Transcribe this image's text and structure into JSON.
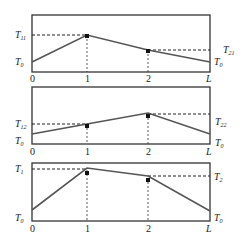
{
  "diagram": {
    "x_ticks": [
      "0",
      "1",
      "2",
      "L"
    ],
    "panels": [
      {
        "name": "panel-1",
        "left_labels": [
          {
            "base": "T",
            "sub": "11"
          },
          {
            "base": "T",
            "sub": "0"
          }
        ],
        "right_labels": [
          {
            "base": "T",
            "sub": "21"
          },
          {
            "base": "T",
            "sub": "0"
          }
        ]
      },
      {
        "name": "panel-2",
        "left_labels": [
          {
            "base": "T",
            "sub": "12"
          },
          {
            "base": "T",
            "sub": "0"
          }
        ],
        "right_labels": [
          {
            "base": "T",
            "sub": "22"
          },
          {
            "base": "T",
            "sub": "0"
          }
        ]
      },
      {
        "name": "panel-3",
        "left_labels": [
          {
            "base": "T",
            "sub": "1"
          },
          {
            "base": "T",
            "sub": "0"
          }
        ],
        "right_labels": [
          {
            "base": "T",
            "sub": "2"
          },
          {
            "base": "T",
            "sub": "0"
          }
        ]
      }
    ]
  }
}
